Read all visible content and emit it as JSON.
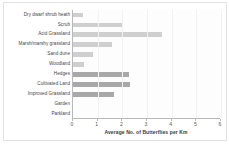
{
  "chart_data": {
    "type": "bar",
    "orientation": "horizontal",
    "title": "",
    "xlabel": "Average No. of Butterflies per Km",
    "ylabel": "",
    "xlim": [
      0,
      6
    ],
    "xticks": [
      "0",
      "1",
      "2",
      "3",
      "4",
      "5",
      "6"
    ],
    "grid": false,
    "legend": "none",
    "categories": [
      "Dry dwarf shrub heath",
      "Scrub",
      "Acid Grassland",
      "Marsh/marshy grassland",
      "Sand dune",
      "Woodland",
      "Hedges",
      "Cultivated Land",
      "Improved Grassland",
      "Garden",
      "Parkland"
    ],
    "values": [
      0.4,
      2.0,
      3.6,
      1.6,
      0.8,
      0.45,
      2.25,
      2.3,
      1.65,
      0,
      0
    ],
    "bar_shades": [
      "light",
      "light",
      "light",
      "light",
      "light",
      "light",
      "dark",
      "dark",
      "dark",
      "light",
      "light"
    ],
    "colors": {
      "bar_light": "#cfcfcf",
      "bar_dark": "#a8a8a8",
      "axis": "#b8b8b8",
      "text": "#444444",
      "background": "#ffffff"
    }
  }
}
